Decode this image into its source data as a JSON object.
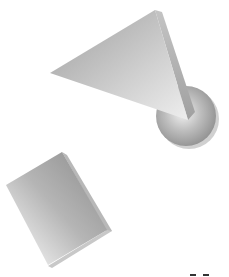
{
  "scene": {
    "description": "Three grey 3D geometric shapes on white background",
    "background": "#ffffff",
    "shapes": [
      {
        "name": "triangle",
        "color": "#bdbdbd"
      },
      {
        "name": "sphere",
        "color": "#a8a8a8"
      },
      {
        "name": "square",
        "color": "#9a9a9a"
      }
    ]
  }
}
